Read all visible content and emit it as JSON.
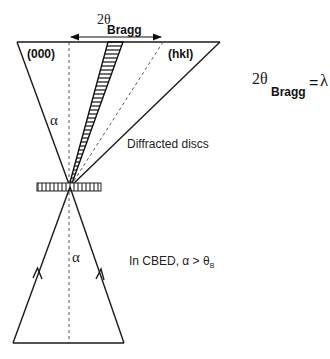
{
  "diagram": {
    "labels": {
      "two_theta_top": "2θ",
      "bragg_top": "Bragg",
      "spot_000": "(000)",
      "spot_hkl": "(hkl)",
      "alpha_upper": "α",
      "alpha_lower": "α",
      "diffracted_discs": "Diffracted discs",
      "cbed_condition": "In CBED, α > θ",
      "cbed_condition_sub": "B"
    },
    "equation": {
      "lhs": "2θ",
      "lhs_sub": "Bragg",
      "equals": "=",
      "numerator": "λ",
      "slash": "/",
      "denominator": "d",
      "denominator_sub": "hkl"
    },
    "colors": {
      "line": "#1a1a1a",
      "dashed": "#555555",
      "background": "#ffffff"
    }
  }
}
